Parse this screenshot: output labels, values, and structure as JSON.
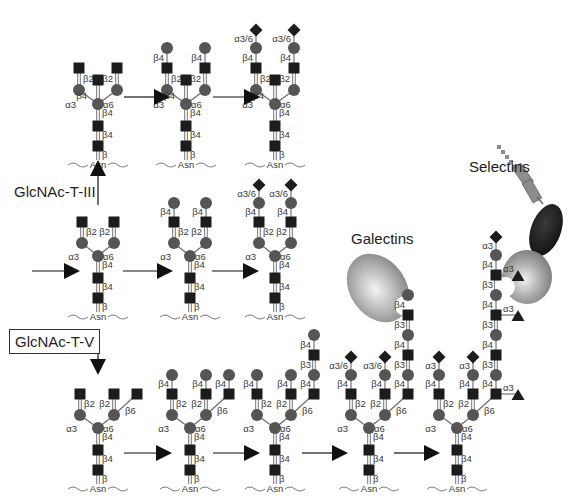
{
  "figure": {
    "colors": {
      "glcnac": "#1c1c1c",
      "mannose_galactose": "#555555",
      "sialic_acid": "#1c1c1c",
      "fucose": "#1c1c1c",
      "bond_line": "#666666",
      "label_text": "#3a3a3a",
      "arrow": "#111111",
      "galectin_fill": "#b8b8b8",
      "selectin_lectin_fill": "#b0b0b0",
      "selectin_egf_fill": "#222222",
      "selectin_cr_fill": "#8c8c8c"
    },
    "enzymes": {
      "gnt3": {
        "label": "GlcNAc-T-III",
        "boxed": false
      },
      "gnt5": {
        "label": "GlcNAc-T-V",
        "boxed": true
      }
    },
    "proteins": {
      "galectins": {
        "label": "Galectins"
      },
      "selectins": {
        "label": "Selectins"
      }
    },
    "anchor_label": "Asn",
    "linkage_labels": [
      "β",
      "β2",
      "β3",
      "β4",
      "β6",
      "α3",
      "α6",
      "α3/6"
    ],
    "structures": [
      {
        "id": "bisected-agalacto",
        "row": 1,
        "col": 1,
        "description": "Biantennary with bisecting GlcNAc (GlcNAc-T-III product)"
      },
      {
        "id": "bisected-galactosylated",
        "row": 1,
        "col": 2,
        "description": "Bisected biantennary, β4-galactosylated"
      },
      {
        "id": "bisected-sialylated",
        "row": 1,
        "col": 3,
        "description": "Bisected biantennary, α3/6-sialylated"
      },
      {
        "id": "biantennary-agalacto",
        "row": 2,
        "col": 1,
        "description": "Biantennary core (GlcNAc β2 on both arms)"
      },
      {
        "id": "biantennary-galactosylated",
        "row": 2,
        "col": 2,
        "description": "Biantennary, β4-galactosylated"
      },
      {
        "id": "biantennary-sialylated",
        "row": 2,
        "col": 3,
        "description": "Biantennary, α3/6-sialylated"
      },
      {
        "id": "branched-agalacto",
        "row": 3,
        "col": 1,
        "description": "β1,6-branched triantennary (GlcNAc-T-V product)"
      },
      {
        "id": "branched-galactosylated",
        "row": 3,
        "col": 2,
        "description": "β1,6-branched, β4-galactosylated"
      },
      {
        "id": "branched-polylacnac",
        "row": 3,
        "col": 3,
        "description": "β1,6-branch extended with poly-N-acetyllactosamine"
      },
      {
        "id": "branched-polylacnac-sialylated",
        "row": 3,
        "col": 4,
        "description": "Sialylated antennae; poly-LacNAc bound by galectin"
      },
      {
        "id": "branched-sialyl-lewis-x",
        "row": 3,
        "col": 5,
        "description": "α3-sialylated, α3-fucosylated poly-LacNAc bound by selectin"
      }
    ]
  }
}
